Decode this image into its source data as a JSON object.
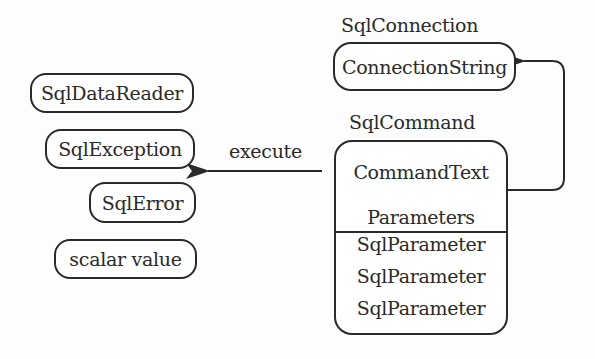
{
  "diagram": {
    "connection": {
      "title": "SqlConnection",
      "property": "ConnectionString"
    },
    "command": {
      "title": "SqlCommand",
      "command_text": "CommandText",
      "parameters_label": "Parameters",
      "parameters": [
        "SqlParameter",
        "SqlParameter",
        "SqlParameter"
      ]
    },
    "execute_label": "execute",
    "results": [
      "SqlDataReader",
      "SqlException",
      "SqlError",
      "scalar value"
    ]
  }
}
